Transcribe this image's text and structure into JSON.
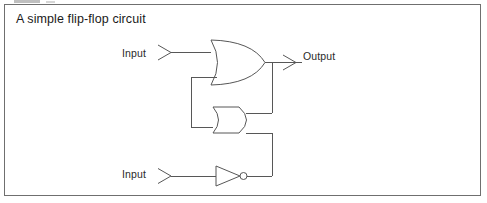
{
  "figure": {
    "caption": "A simple flip-flop circuit",
    "border_color": "#6f6f6f",
    "background": "#ffffff"
  },
  "circuit": {
    "line_color": "#575757",
    "labels": {
      "input_top": "Input",
      "input_bottom": "Input",
      "output": "Output"
    },
    "gates": [
      {
        "id": "or-gate",
        "type": "OR",
        "inputs": 2,
        "note": "top gate, curved back, pointed output"
      },
      {
        "id": "and-gate",
        "type": "AND",
        "inputs": 2,
        "note": "middle gate, flat back, rounded output"
      },
      {
        "id": "not-gate",
        "type": "NOT",
        "inputs": 1,
        "note": "bottom inverter, triangle with bubble"
      }
    ],
    "nets": [
      "Input(top) -> OR input A",
      "OR output -> Output port",
      "OR output -> junction -> AND input A (down-left feed)",
      "AND output -> feedback up-left -> OR input B",
      "Input(bottom) -> NOT input",
      "NOT output -> up -> AND input B"
    ]
  }
}
